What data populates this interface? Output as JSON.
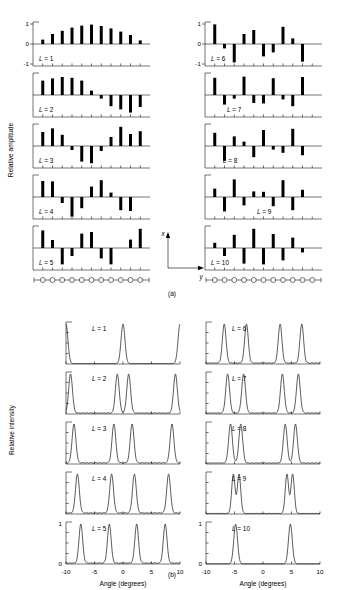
{
  "figure": {
    "subfigure_a_label": "(a)",
    "subfigure_b_label": "(b)",
    "panel_a": {
      "ylabel": "Relative amplitude",
      "ytick_labels": [
        "1",
        "0",
        "-1"
      ],
      "ytick_values": [
        1,
        0,
        -1
      ],
      "axis_diagram": {
        "x_label": "x",
        "y_label": "y"
      },
      "array_elements": 11
    },
    "panel_b": {
      "ylabel": "Relative intensity",
      "xlabel": "Angle (degrees)",
      "xtick_labels": [
        "-10",
        "-5",
        "0",
        "5",
        "10"
      ],
      "xtick_values": [
        -10,
        -5,
        0,
        5,
        10
      ],
      "ytick_labels": [
        "0",
        "1"
      ],
      "ytick_values": [
        0,
        1
      ]
    }
  },
  "chart_data": [
    {
      "type": "bar",
      "id": "amplitudes",
      "title": "Relative amplitude of array element excitation",
      "xlabel": "",
      "ylabel": "Relative amplitude",
      "ylim": [
        -1,
        1
      ],
      "n_elements": 11,
      "element_index": [
        1,
        2,
        3,
        4,
        5,
        6,
        7,
        8,
        9,
        10,
        11
      ],
      "series": [
        {
          "name": "L = 1",
          "label": "L = 1",
          "values": [
            0.22,
            0.5,
            0.66,
            0.82,
            0.92,
            0.97,
            0.9,
            0.78,
            0.62,
            0.45,
            0.18
          ]
        },
        {
          "name": "L = 2",
          "label": "L = 2",
          "values": [
            0.72,
            0.83,
            0.9,
            0.86,
            0.72,
            0.22,
            -0.18,
            -0.56,
            -0.72,
            -0.88,
            -0.6
          ]
        },
        {
          "name": "L = 3",
          "label": "L = 3",
          "values": [
            0.7,
            0.88,
            0.56,
            -0.2,
            -0.78,
            -0.86,
            -0.25,
            0.45,
            0.96,
            0.6,
            0.74
          ]
        },
        {
          "name": "L = 4",
          "label": "L = 4",
          "values": [
            0.8,
            0.78,
            -0.3,
            -0.98,
            -0.56,
            0.52,
            0.84,
            0.22,
            -0.66,
            -0.7,
            0.0
          ]
        },
        {
          "name": "L = 5",
          "label": "L = 5",
          "values": [
            0.88,
            0.4,
            -0.82,
            -0.4,
            0.72,
            0.8,
            -0.52,
            -0.82,
            0.0,
            0.42,
            0.96
          ]
        },
        {
          "name": "L = 6",
          "label": "L = 6",
          "values": [
            0.98,
            -0.22,
            -0.92,
            0.5,
            0.7,
            -0.62,
            -0.42,
            0.86,
            0.28,
            -0.88,
            0.0
          ]
        },
        {
          "name": "L = 7",
          "label": "L = 7",
          "values": [
            0.86,
            -0.48,
            -0.18,
            0.92,
            -0.4,
            -0.42,
            0.84,
            -0.22,
            -0.56,
            0.9,
            0.0
          ]
        },
        {
          "name": "L = 8",
          "label": "L = 8",
          "values": [
            0.66,
            -0.74,
            0.48,
            0.22,
            -0.56,
            0.8,
            -0.18,
            -0.34,
            0.86,
            -0.46,
            0.0
          ]
        },
        {
          "name": "L = 9",
          "label": "L = 9",
          "values": [
            0.42,
            -0.72,
            0.88,
            -0.42,
            0.28,
            0.26,
            -0.46,
            0.84,
            -0.66,
            0.36,
            0.0
          ]
        },
        {
          "name": "L = 10",
          "label": "L = 10",
          "values": [
            0.26,
            -0.4,
            0.66,
            -0.78,
            0.96,
            -0.82,
            0.7,
            -0.62,
            0.52,
            -0.22,
            0.0
          ]
        }
      ]
    },
    {
      "type": "line",
      "id": "intensities",
      "title": "Relative far-field intensity vs angle",
      "xlabel": "Angle (degrees)",
      "ylabel": "Relative intensity",
      "xlim": [
        -10,
        10
      ],
      "ylim": [
        0,
        1.05
      ],
      "series": [
        {
          "name": "L = 1",
          "label": "L = 1",
          "peaks": [
            -10.0,
            0.0,
            10.0
          ],
          "peak_heights": [
            1.0,
            1.0,
            1.0
          ],
          "peak_width": 0.72,
          "sidelobe": 0.012
        },
        {
          "name": "L = 2",
          "label": "L = 2",
          "peaks": [
            -9.2,
            -1.0,
            1.0,
            9.2
          ],
          "peak_heights": [
            1.0,
            1.0,
            1.0,
            1.0
          ],
          "peak_width": 0.7,
          "sidelobe": 0.03
        },
        {
          "name": "L = 3",
          "label": "L = 3",
          "peaks": [
            -8.6,
            -1.6,
            1.6,
            8.6
          ],
          "peak_heights": [
            1.0,
            1.0,
            1.0,
            1.0
          ],
          "peak_width": 0.7,
          "sidelobe": 0.035
        },
        {
          "name": "L = 4",
          "label": "L = 4",
          "peaks": [
            -8.0,
            -2.0,
            2.0,
            8.0
          ],
          "peak_heights": [
            1.0,
            1.0,
            1.0,
            1.0
          ],
          "peak_width": 0.7,
          "sidelobe": 0.032
        },
        {
          "name": "L = 5",
          "label": "L = 5",
          "peaks": [
            -7.4,
            -2.4,
            2.4,
            7.4
          ],
          "peak_heights": [
            1.0,
            1.0,
            1.0,
            1.0
          ],
          "peak_width": 0.68,
          "sidelobe": 0.028
        },
        {
          "name": "L = 6",
          "label": "L = 6",
          "peaks": [
            -6.8,
            -2.9,
            3.0,
            6.8
          ],
          "peak_heights": [
            1.0,
            1.0,
            1.0,
            1.0
          ],
          "peak_width": 0.68,
          "sidelobe": 0.03
        },
        {
          "name": "L = 7",
          "label": "L = 7",
          "peaks": [
            -6.2,
            -3.4,
            3.4,
            6.2
          ],
          "peak_heights": [
            1.0,
            1.0,
            1.0,
            1.0
          ],
          "peak_width": 0.7,
          "sidelobe": 0.03
        },
        {
          "name": "L = 8",
          "label": "L = 8",
          "peaks": [
            -5.7,
            -3.9,
            3.9,
            5.7
          ],
          "peak_heights": [
            1.0,
            1.0,
            1.0,
            1.0
          ],
          "peak_width": 0.7,
          "sidelobe": 0.03
        },
        {
          "name": "L = 9",
          "label": "L = 9",
          "peaks": [
            -5.2,
            -4.2,
            4.2,
            5.2
          ],
          "peak_heights": [
            1.0,
            1.0,
            1.0,
            1.0
          ],
          "peak_width": 0.62,
          "sidelobe": 0.016
        },
        {
          "name": "L = 10",
          "label": "L = 10",
          "peaks": [
            -4.8,
            4.8
          ],
          "peak_heights": [
            1.0,
            1.0
          ],
          "peak_width": 0.7,
          "sidelobe": 0.006
        }
      ]
    }
  ]
}
